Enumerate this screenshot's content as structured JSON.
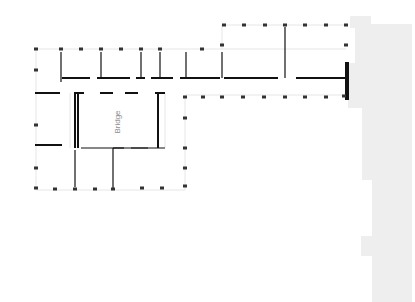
{
  "map": {
    "width": 415,
    "height": 302,
    "background": "#ffffff",
    "colors": {
      "wall": "#111111",
      "faint": "#e6e6e6",
      "neighbor": "#eeeeee",
      "label": "#8a8a8a"
    },
    "labels": [
      {
        "text": "Bridge",
        "x": 120,
        "y": 122,
        "rotate": -90
      }
    ],
    "neighbor_building": {
      "points": "350,16 371,16 371,24 412,24 412,302 372,302 372,256 361,256 361,236 372,236 372,180 362,180 362,108 348,108 348,63 355,63 355,28 350,28"
    },
    "thick_walls": [
      [
        35,
        93,
        60,
        93
      ],
      [
        35,
        145,
        62,
        145
      ],
      [
        75,
        93,
        75,
        148
      ],
      [
        78,
        93,
        78,
        148
      ],
      [
        74,
        93,
        84,
        93
      ],
      [
        158,
        93,
        158,
        148
      ],
      [
        155,
        93,
        165,
        93
      ],
      [
        62,
        78,
        90,
        78
      ],
      [
        97,
        78,
        130,
        78
      ],
      [
        136,
        78,
        145,
        78
      ],
      [
        151,
        78,
        173,
        78
      ],
      [
        180,
        78,
        220,
        78
      ],
      [
        224,
        78,
        278,
        78
      ],
      [
        285,
        78,
        285,
        78
      ],
      [
        296,
        78,
        346,
        78
      ],
      [
        346,
        62,
        346,
        100
      ],
      [
        348,
        62,
        348,
        100
      ],
      [
        100,
        93,
        113,
        93
      ],
      [
        125,
        93,
        138,
        93
      ]
    ],
    "thin_walls": [
      [
        61,
        52,
        61,
        82
      ],
      [
        101,
        52,
        101,
        78
      ],
      [
        141,
        52,
        141,
        78
      ],
      [
        160,
        52,
        160,
        78
      ],
      [
        186,
        52,
        186,
        78
      ],
      [
        222,
        52,
        222,
        78
      ],
      [
        285,
        27,
        285,
        78
      ],
      [
        81,
        148,
        148,
        148
      ],
      [
        113,
        148,
        124,
        148
      ],
      [
        131,
        148,
        165,
        148
      ],
      [
        75,
        150,
        75,
        187
      ],
      [
        113,
        148,
        113,
        188
      ]
    ],
    "faint_lines": [
      [
        36,
        49,
        346,
        49
      ],
      [
        36,
        49,
        36,
        190
      ],
      [
        36,
        190,
        185,
        190
      ],
      [
        185,
        95,
        185,
        190
      ],
      [
        185,
        95,
        346,
        95
      ],
      [
        222,
        25,
        346,
        25
      ],
      [
        222,
        25,
        222,
        49
      ],
      [
        70,
        93,
        70,
        148
      ],
      [
        165,
        93,
        165,
        148
      ]
    ],
    "markers": [
      [
        36,
        49
      ],
      [
        61,
        49
      ],
      [
        81,
        49
      ],
      [
        101,
        49
      ],
      [
        121,
        49
      ],
      [
        141,
        49
      ],
      [
        160,
        49
      ],
      [
        202,
        49
      ],
      [
        222,
        45
      ],
      [
        224,
        25
      ],
      [
        244,
        25
      ],
      [
        265,
        25
      ],
      [
        285,
        25
      ],
      [
        305,
        25
      ],
      [
        326,
        25
      ],
      [
        346,
        25
      ],
      [
        346,
        45
      ],
      [
        185,
        97
      ],
      [
        203,
        97
      ],
      [
        222,
        97
      ],
      [
        243,
        97
      ],
      [
        264,
        97
      ],
      [
        285,
        97
      ],
      [
        305,
        97
      ],
      [
        326,
        97
      ],
      [
        344,
        96
      ],
      [
        36,
        70
      ],
      [
        36,
        125
      ],
      [
        36,
        168
      ],
      [
        185,
        118
      ],
      [
        185,
        148
      ],
      [
        185,
        168
      ],
      [
        36,
        188
      ],
      [
        55,
        189
      ],
      [
        75,
        189
      ],
      [
        95,
        189
      ],
      [
        113,
        189
      ],
      [
        142,
        188
      ],
      [
        162,
        188
      ],
      [
        185,
        186
      ]
    ]
  }
}
